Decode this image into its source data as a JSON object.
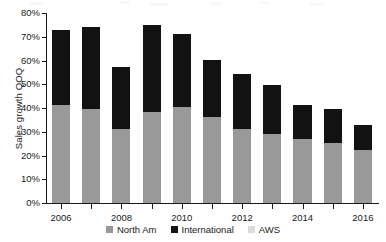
{
  "chart_data": {
    "type": "bar",
    "title": "",
    "subtitle": "",
    "xlabel": "",
    "ylabel": "Sales growth QOQ",
    "stacked": true,
    "grid": false,
    "legend_position": "bottom",
    "ylim": [
      0,
      80
    ],
    "ytick_values": [
      0,
      10,
      20,
      30,
      40,
      50,
      60,
      70,
      80
    ],
    "ytick_labels": [
      "0%",
      "10%",
      "20%",
      "30%",
      "40%",
      "50%",
      "60%",
      "70%",
      "80%"
    ],
    "categories": [
      2006,
      2007,
      2008,
      2009,
      2010,
      2011,
      2012,
      2013,
      2014,
      2015,
      2016
    ],
    "xtick_labels": [
      "2006",
      "",
      "2008",
      "",
      "2010",
      "",
      "2012",
      "",
      "2014",
      "",
      "2016"
    ],
    "series": [
      {
        "name": "North Am",
        "color": "#999999",
        "values": [
          41.3,
          39.5,
          31.0,
          38.5,
          40.5,
          36.3,
          31.0,
          29.0,
          27.0,
          25.3,
          22.3
        ]
      },
      {
        "name": "International",
        "color": "#121212",
        "values": [
          31.5,
          34.5,
          26.3,
          36.3,
          30.8,
          24.0,
          23.2,
          20.7,
          14.4,
          14.3,
          10.5
        ]
      },
      {
        "name": "AWS",
        "color": "#dcdcdc",
        "values": [
          0,
          0,
          0,
          0,
          0,
          0,
          0,
          0,
          0,
          0,
          0
        ]
      }
    ],
    "totals": [
      72.8,
      74.0,
      57.3,
      74.8,
      71.3,
      60.3,
      54.2,
      49.7,
      41.4,
      39.6,
      32.8
    ]
  },
  "legend": {
    "items": [
      {
        "label": "North Am",
        "color": "#999999"
      },
      {
        "label": "International",
        "color": "#121212"
      },
      {
        "label": "AWS",
        "color": "#dcdcdc"
      }
    ]
  },
  "axes": {
    "y_title": "Sales growth QOQ"
  }
}
